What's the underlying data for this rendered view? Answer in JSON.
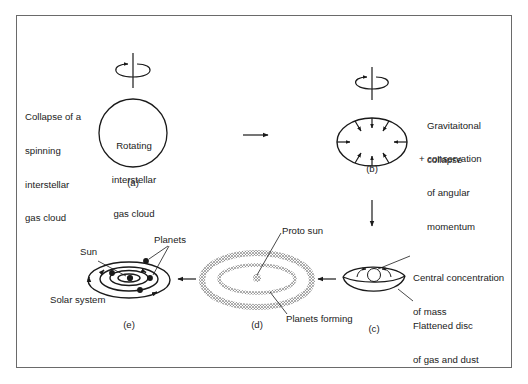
{
  "figure": {
    "stages": [
      {
        "id": "a",
        "caption": "(a)",
        "inner_label": [
          "Rotating",
          "interstellar",
          "gas cloud"
        ],
        "side_label": [
          "Collapse of a",
          "spinning",
          "interstellar",
          "gas cloud"
        ]
      },
      {
        "id": "b",
        "caption": "(b)",
        "side_label": [
          "Gravitaitonal",
          "collapse"
        ],
        "side_label_2": [
          "+ conservation",
          "of angular",
          "momentum"
        ]
      },
      {
        "id": "c",
        "caption": "(c)",
        "label_top": [
          "Central concentration",
          "of mass"
        ],
        "label_bottom": [
          "Flattened disc",
          "of gas and dust"
        ]
      },
      {
        "id": "d",
        "caption": "(d)",
        "label_top": "Proto sun",
        "label_bottom": "Planets forming"
      },
      {
        "id": "e",
        "caption": "(e)",
        "label_sun": "Sun",
        "label_planets": "Planets",
        "label_system": "Solar system"
      }
    ],
    "flow": [
      "a",
      "b",
      "c",
      "d",
      "e"
    ],
    "colors": {
      "line": "#1a1a1a",
      "frame": "#6a6a6a",
      "background": "#ffffff"
    }
  }
}
